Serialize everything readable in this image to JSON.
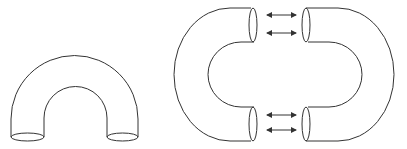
{
  "figure": {
    "background": "#ffffff",
    "stroke_color": "#333333",
    "panels": [
      {
        "id": "whole-u-tube",
        "description": "Bent tube (U shape) with two open ends at the bottom"
      },
      {
        "id": "split-tube-halves",
        "description": "Two C-shaped tube halves facing each other with double-headed arrows between their open ends"
      }
    ],
    "arrows": {
      "count": 4,
      "type": "double-headed",
      "positions_y": [
        15,
        33,
        115,
        130
      ]
    }
  }
}
